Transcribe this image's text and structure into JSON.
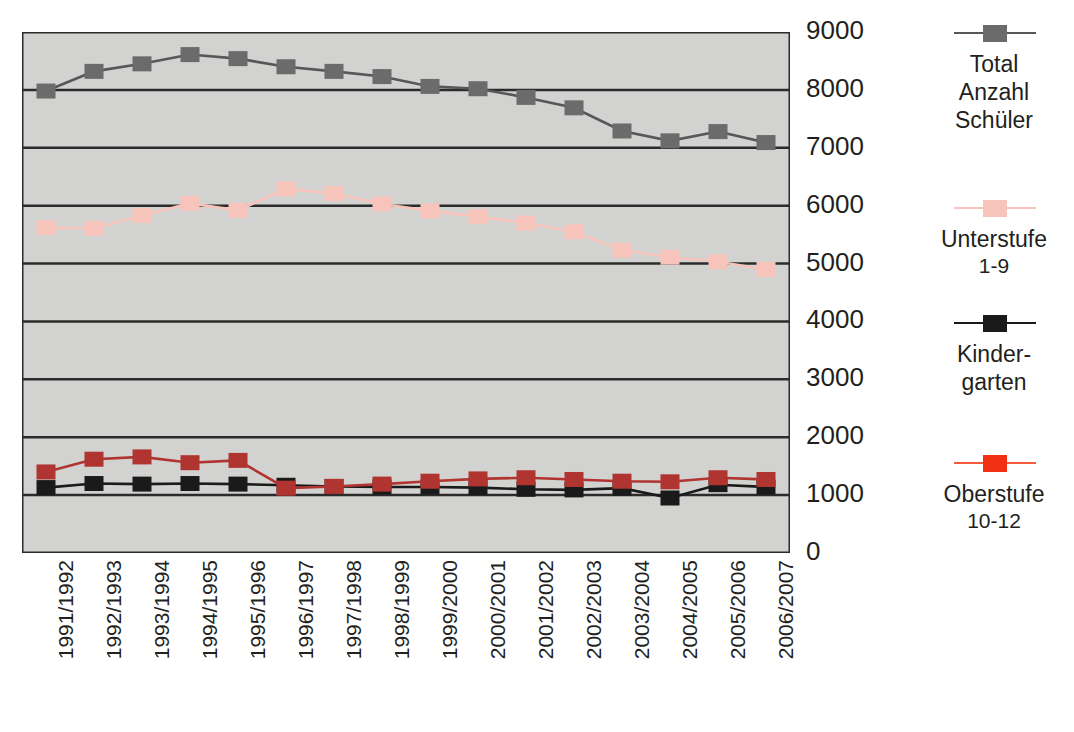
{
  "chart_data": {
    "type": "line",
    "title": "",
    "xlabel": "",
    "ylabel": "",
    "ylim": [
      0,
      9000
    ],
    "ytick_step": 1000,
    "grid": true,
    "legend_position": "right",
    "plot_background": "#d2d2d0",
    "categories": [
      "1991/1992",
      "1992/1993",
      "1993/1994",
      "1994/1995",
      "1995/1996",
      "1996/1997",
      "1997/1998",
      "1998/1999",
      "1999/2000",
      "2000/2001",
      "2001/2002",
      "2002/2003",
      "2003/2004",
      "2004/2005",
      "2005/2006",
      "2006/2007"
    ],
    "ytick_labels": [
      "9000",
      "8000",
      "7000",
      "6000",
      "5000",
      "4000",
      "3000",
      "2000",
      "1000",
      "0"
    ],
    "ytick_values": [
      9000,
      8000,
      7000,
      6000,
      5000,
      4000,
      3000,
      2000,
      1000,
      0
    ],
    "series": [
      {
        "name": "Total Anzahl Schüler",
        "color": "#6b6b6b",
        "line_color": "#57575a",
        "values": [
          7980,
          8320,
          8450,
          8610,
          8540,
          8400,
          8320,
          8230,
          8060,
          8020,
          7870,
          7690,
          7290,
          7120,
          7280,
          7090
        ]
      },
      {
        "name": "Unterstufe 1-9",
        "color": "#f7c4bc",
        "line_color": "#f7c4bc",
        "values": [
          5620,
          5610,
          5830,
          6040,
          5920,
          6290,
          6210,
          6030,
          5910,
          5810,
          5700,
          5550,
          5230,
          5110,
          5030,
          4900
        ]
      },
      {
        "name": "Kinder-garten",
        "color": "#1a1a1a",
        "line_color": "#1a1a1a",
        "values": [
          1130,
          1200,
          1190,
          1200,
          1190,
          1170,
          1150,
          1140,
          1140,
          1130,
          1100,
          1090,
          1120,
          950,
          1180,
          1140
        ]
      },
      {
        "name": "Oberstufe 10-12",
        "color": "#b03430",
        "line_color": "#b03430",
        "values": [
          1400,
          1620,
          1660,
          1560,
          1600,
          1120,
          1150,
          1190,
          1240,
          1280,
          1300,
          1270,
          1240,
          1230,
          1300,
          1270
        ]
      }
    ]
  },
  "legend": {
    "entries": [
      {
        "name": "total-anzahl-schueler",
        "label": "Total\nAnzahl\nSchüler",
        "sub": "",
        "marker_color": "#6b6b6b",
        "line_color": "#57575a"
      },
      {
        "name": "unterstufe",
        "label": "Unterstufe",
        "sub": "1-9",
        "marker_color": "#f7c4bc",
        "line_color": "#f7c4bc"
      },
      {
        "name": "kindergarten",
        "label": "Kinder-\ngarten",
        "sub": "",
        "marker_color": "#1a1a1a",
        "line_color": "#1a1a1a"
      },
      {
        "name": "oberstufe",
        "label": "Oberstufe",
        "sub": "10-12",
        "marker_color": "#f23014",
        "line_color": "#f75a3c"
      }
    ]
  },
  "colors": {
    "plot_background": "#d2d2d0",
    "page_background": "#ffffff",
    "gridline": "#2b2b2b",
    "text": "#231f20"
  }
}
